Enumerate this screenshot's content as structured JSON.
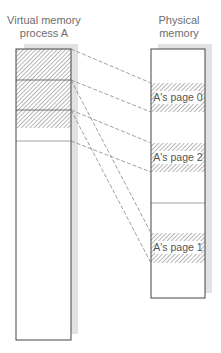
{
  "diagram": {
    "left_column": {
      "title_line1": "Virtual memory",
      "title_line2": "process A",
      "pages": [
        {
          "name": "page 0",
          "hatched": true
        },
        {
          "name": "page 1",
          "hatched": true
        },
        {
          "name": "page 2",
          "hatched": true
        }
      ]
    },
    "right_column": {
      "title_line1": "Physical",
      "title_line2": "memory",
      "frames": [
        {
          "label": "A's page 0",
          "hatched": true
        },
        {
          "label": "A's page 2",
          "hatched": true
        },
        {
          "label": "A's page 1",
          "hatched": true
        }
      ]
    },
    "mappings": [
      {
        "from": "page 0",
        "to": "A's page 0"
      },
      {
        "from": "page 1",
        "to": "A's page 1"
      },
      {
        "from": "page 2",
        "to": "A's page 2"
      }
    ],
    "colors": {
      "box_border": "#444444",
      "shadow": "#e2e2e2",
      "hatch": "#777777",
      "text": "#6e6e6e",
      "dashed_line": "#777777"
    }
  }
}
